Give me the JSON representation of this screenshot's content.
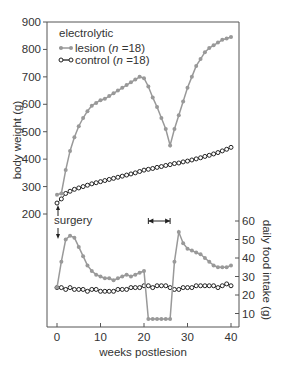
{
  "chart_data": [
    {
      "panel": "body-weight",
      "type": "line",
      "ylabel": "body weight (g)",
      "ylim": [
        200,
        900
      ],
      "yticks": [
        200,
        300,
        400,
        500,
        600,
        700,
        800,
        900
      ],
      "xlim": [
        0,
        40
      ],
      "legend": {
        "title": "electrolytic",
        "entries": [
          {
            "label": "lesion (n =18)",
            "marker": "filled-circle",
            "color": "#999999"
          },
          {
            "label": "control (n =18)",
            "marker": "open-circle",
            "color": "#222222"
          }
        ],
        "position": "upper-left"
      },
      "series": [
        {
          "name": "lesion",
          "x": [
            0,
            1,
            2,
            3,
            4,
            5,
            6,
            7,
            8,
            9,
            10,
            11,
            12,
            13,
            14,
            15,
            16,
            17,
            18,
            19,
            20,
            21,
            22,
            23,
            24,
            25,
            26,
            27,
            28,
            29,
            30,
            31,
            32,
            33,
            34,
            35,
            36,
            37,
            38,
            39,
            40
          ],
          "values": [
            270,
            275,
            360,
            430,
            480,
            520,
            550,
            575,
            595,
            605,
            615,
            620,
            630,
            640,
            650,
            660,
            670,
            680,
            690,
            700,
            695,
            665,
            625,
            590,
            550,
            510,
            450,
            510,
            560,
            610,
            660,
            700,
            740,
            765,
            790,
            805,
            815,
            825,
            835,
            840,
            845
          ]
        },
        {
          "name": "control",
          "x": [
            0,
            1,
            2,
            3,
            4,
            5,
            6,
            7,
            8,
            9,
            10,
            11,
            12,
            13,
            14,
            15,
            16,
            17,
            18,
            19,
            20,
            21,
            22,
            23,
            24,
            25,
            26,
            27,
            28,
            29,
            30,
            31,
            32,
            33,
            34,
            35,
            36,
            37,
            38,
            39,
            40
          ],
          "values": [
            240,
            255,
            275,
            283,
            290,
            295,
            300,
            305,
            310,
            314,
            318,
            322,
            326,
            330,
            334,
            338,
            342,
            346,
            350,
            355,
            360,
            363,
            366,
            370,
            373,
            377,
            380,
            384,
            386,
            390,
            393,
            397,
            401,
            405,
            410,
            414,
            419,
            424,
            430,
            436,
            443
          ]
        }
      ]
    },
    {
      "panel": "food-intake",
      "type": "line",
      "ylabel": "daily food intake (g)",
      "ylim": [
        5,
        60
      ],
      "yticks": [
        10,
        20,
        30,
        40,
        50,
        60
      ],
      "xlabel": "weeks postlesion",
      "xticks": [
        0,
        10,
        20,
        30,
        40
      ],
      "xlim": [
        0,
        40
      ],
      "series": [
        {
          "name": "lesion",
          "x": [
            0,
            1,
            2,
            3,
            4,
            5,
            6,
            7,
            8,
            9,
            10,
            11,
            12,
            13,
            14,
            15,
            16,
            17,
            18,
            19,
            20,
            21,
            22,
            23,
            24,
            25,
            26,
            27,
            28,
            29,
            30,
            31,
            32,
            33,
            34,
            35,
            36,
            37,
            38,
            39,
            40
          ],
          "values": [
            24,
            38,
            50,
            52,
            51,
            46,
            41,
            36,
            33,
            31,
            30,
            29,
            29,
            28,
            29,
            30,
            31,
            30,
            31,
            32,
            33,
            7,
            7,
            7,
            7,
            7,
            7,
            38,
            54,
            48,
            45,
            44,
            43,
            42,
            40,
            38,
            36,
            35,
            35,
            35,
            36
          ]
        },
        {
          "name": "control",
          "x": [
            0,
            1,
            2,
            3,
            4,
            5,
            6,
            7,
            8,
            9,
            10,
            11,
            12,
            13,
            14,
            15,
            16,
            17,
            18,
            19,
            20,
            21,
            22,
            23,
            24,
            25,
            26,
            27,
            28,
            29,
            30,
            31,
            32,
            33,
            34,
            35,
            36,
            37,
            38,
            39,
            40
          ],
          "values": [
            24,
            24,
            23,
            24,
            23,
            23,
            23,
            22,
            23,
            23,
            22,
            22,
            22,
            22,
            23,
            23,
            23,
            24,
            24,
            24,
            25,
            25,
            24,
            25,
            25,
            25,
            24,
            23,
            23,
            24,
            24,
            24,
            25,
            25,
            25,
            25,
            25,
            24,
            25,
            26,
            25
          ]
        }
      ]
    }
  ],
  "annotations": {
    "surgery_label": "surgery",
    "bracket_from_week": 21,
    "bracket_to_week": 26
  },
  "axes": {
    "left_label": "body weight (g)",
    "right_label": "daily food intake (g)",
    "x_label": "weeks postlesion",
    "left_ticks": [
      "900",
      "800",
      "700",
      "600",
      "500",
      "400",
      "300",
      "200"
    ],
    "right_ticks": [
      "60",
      "50",
      "40",
      "30",
      "20",
      "10"
    ],
    "x_ticks": [
      "0",
      "10",
      "20",
      "30",
      "40"
    ]
  },
  "legend": {
    "title": "electrolytic",
    "lesion_label": "lesion (",
    "control_label": "control (",
    "n_label": "n",
    "n_value": " =18)"
  },
  "colors": {
    "lesion": "#999999",
    "control": "#222222",
    "axis": "#444444"
  }
}
